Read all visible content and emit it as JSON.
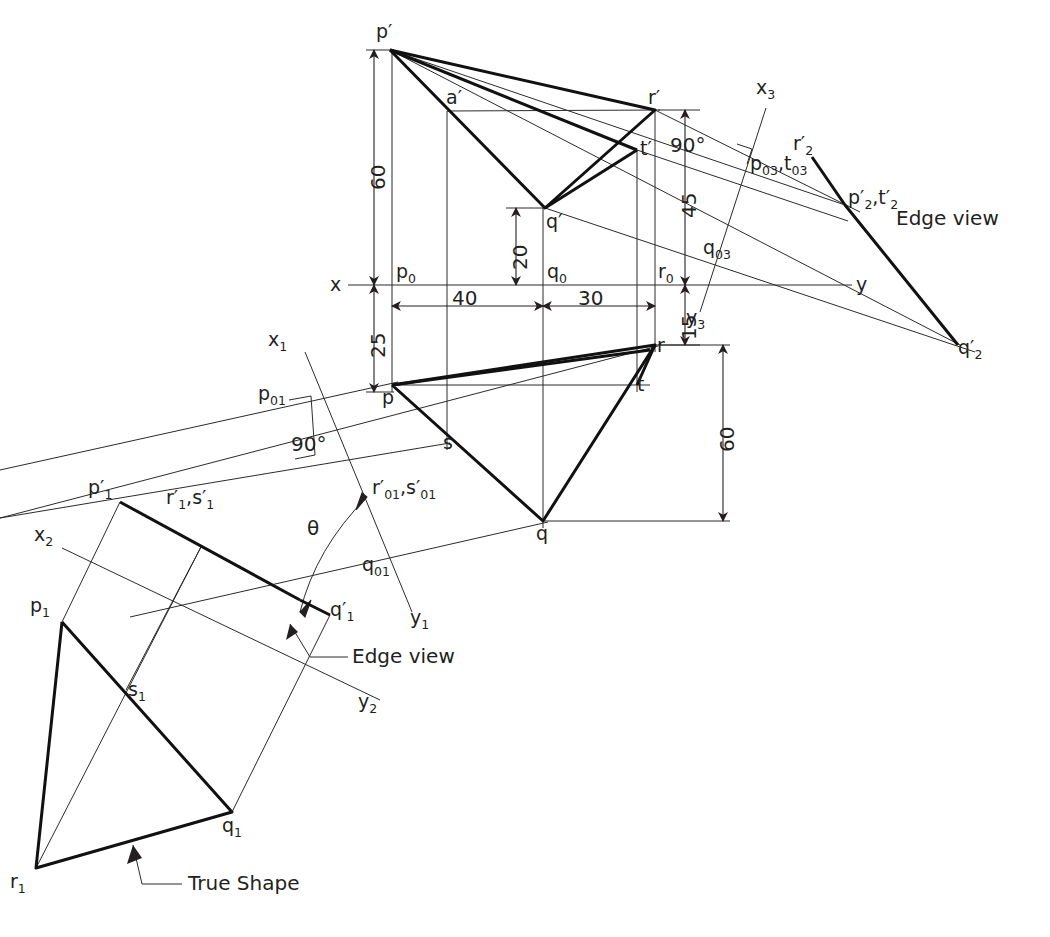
{
  "figure": {
    "notes": {
      "edge_view_right": "Edge view",
      "edge_view_aux": "Edge view",
      "true_shape": "True Shape"
    }
  },
  "reference_lines": {
    "x_label": "x",
    "y_label": "y",
    "x1_label": "x",
    "x1_sub": "1",
    "y1_label": "y",
    "y1_sub": "1",
    "x2_label": "x",
    "x2_sub": "2",
    "y2_label": "y",
    "y2_sub": "2",
    "x3_label": "x",
    "x3_sub": "3",
    "y3_label": "y",
    "y3_sub": "3"
  },
  "dimensions": [
    {
      "id": "dim-60-left",
      "value": "60",
      "orientation": "vertical"
    },
    {
      "id": "dim-25-left",
      "value": "25",
      "orientation": "vertical"
    },
    {
      "id": "dim-20-mid",
      "value": "20",
      "orientation": "vertical"
    },
    {
      "id": "dim-45-right",
      "value": "45",
      "orientation": "vertical"
    },
    {
      "id": "dim-15-right",
      "value": "15",
      "orientation": "vertical"
    },
    {
      "id": "dim-60-right",
      "value": "60",
      "orientation": "vertical"
    },
    {
      "id": "dim-40-bottom",
      "value": "40",
      "orientation": "horizontal"
    },
    {
      "id": "dim-30-bottom",
      "value": "30",
      "orientation": "horizontal"
    }
  ],
  "angles": [
    {
      "id": "angle-90-aux1",
      "value": "90°"
    },
    {
      "id": "angle-90-aux3",
      "value": "90°"
    },
    {
      "id": "angle-theta",
      "value": "θ"
    }
  ],
  "front_view": {
    "name": "Front view (elevation)",
    "points": [
      {
        "id": "p-prime",
        "label": "p",
        "prime": "′",
        "sub": ""
      },
      {
        "id": "a-prime",
        "label": "a",
        "prime": "′",
        "sub": ""
      },
      {
        "id": "r-prime",
        "label": "r",
        "prime": "′",
        "sub": ""
      },
      {
        "id": "t-prime",
        "label": "t",
        "prime": "′",
        "sub": ""
      },
      {
        "id": "q-prime",
        "label": "q",
        "prime": "′",
        "sub": ""
      }
    ]
  },
  "top_view": {
    "name": "Top view (plan)",
    "points": [
      {
        "id": "p",
        "label": "p"
      },
      {
        "id": "q",
        "label": "q"
      },
      {
        "id": "r",
        "label": "r"
      },
      {
        "id": "s",
        "label": "s"
      },
      {
        "id": "t",
        "label": "t"
      }
    ]
  },
  "ground_points": [
    {
      "id": "p0",
      "label": "p",
      "sub": "0"
    },
    {
      "id": "q0",
      "label": "q",
      "sub": "0"
    },
    {
      "id": "r0",
      "label": "r",
      "sub": "0"
    },
    {
      "id": "p01",
      "label": "p",
      "sub": "01"
    },
    {
      "id": "q01",
      "label": "q",
      "sub": "01"
    },
    {
      "id": "rs01",
      "label": "r′",
      "sub": "01",
      "label2": ",s′",
      "sub2": "01"
    },
    {
      "id": "q03",
      "label": "q",
      "sub": "03"
    },
    {
      "id": "pt03",
      "label": "p",
      "sub": "03",
      "label2": ",t",
      "sub2": "03"
    }
  ],
  "aux_view_1": {
    "name": "First auxiliary view (edge view)",
    "points": [
      {
        "id": "p1-prime",
        "label": "p′",
        "sub": "1"
      },
      {
        "id": "q1-prime",
        "label": "q′",
        "sub": "1"
      },
      {
        "id": "rs1-prime",
        "label": "r′",
        "sub": "1",
        "label2": ",s′",
        "sub2": "1"
      }
    ]
  },
  "aux_view_2": {
    "name": "Second auxiliary view (true shape)",
    "points": [
      {
        "id": "p1",
        "label": "p",
        "sub": "1"
      },
      {
        "id": "q1",
        "label": "q",
        "sub": "1"
      },
      {
        "id": "r1",
        "label": "r",
        "sub": "1"
      },
      {
        "id": "s1",
        "label": "s",
        "sub": "1"
      }
    ]
  },
  "aux_view_3": {
    "name": "Third auxiliary view (edge view right)",
    "points": [
      {
        "id": "r2-prime",
        "label": "r′",
        "sub": "2"
      },
      {
        "id": "pt2-prime",
        "label": "p′",
        "sub": "2",
        "label2": ",t′",
        "sub2": "2"
      },
      {
        "id": "q2-prime",
        "label": "q′",
        "sub": "2"
      }
    ]
  },
  "colors": {
    "ink": "#231f20",
    "thin": "#3b3b3b",
    "paper": "#ffffff"
  }
}
